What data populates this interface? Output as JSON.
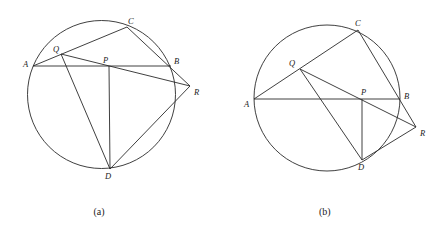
{
  "figures": [
    {
      "id": "a",
      "caption": "(a)",
      "circle": {
        "cx": 101.5,
        "cy": 94.5,
        "r": 74
      },
      "points": {
        "A": {
          "x": 33,
          "y": 66,
          "label": "A"
        },
        "B": {
          "x": 171,
          "y": 66,
          "label": "B"
        },
        "C": {
          "x": 127,
          "y": 27,
          "label": "C"
        },
        "D": {
          "x": 110,
          "y": 169,
          "label": "D"
        },
        "P": {
          "x": 109,
          "y": 66,
          "label": "P"
        },
        "Q": {
          "x": 61,
          "y": 54,
          "label": "Q"
        },
        "R": {
          "x": 190,
          "y": 86,
          "label": "R"
        }
      },
      "segments": [
        [
          "A",
          "B"
        ],
        [
          "A",
          "C"
        ],
        [
          "C",
          "R"
        ],
        [
          "Q",
          "R"
        ],
        [
          "Q",
          "D"
        ],
        [
          "P",
          "D"
        ],
        [
          "D",
          "R"
        ]
      ]
    },
    {
      "id": "b",
      "caption": "(b)",
      "circle": {
        "cx": 327,
        "cy": 98,
        "r": 73
      },
      "points": {
        "A": {
          "x": 254,
          "y": 99,
          "label": "A"
        },
        "B": {
          "x": 400,
          "y": 99,
          "label": "B"
        },
        "C": {
          "x": 358,
          "y": 30,
          "label": "C"
        },
        "D": {
          "x": 362,
          "y": 160,
          "label": "D"
        },
        "P": {
          "x": 362,
          "y": 99,
          "label": "P"
        },
        "Q": {
          "x": 300,
          "y": 69,
          "label": "Q"
        },
        "R": {
          "x": 416,
          "y": 127,
          "label": "R"
        }
      },
      "segments": [
        [
          "A",
          "B"
        ],
        [
          "A",
          "C"
        ],
        [
          "C",
          "R"
        ],
        [
          "Q",
          "R"
        ],
        [
          "Q",
          "D"
        ],
        [
          "P",
          "D"
        ],
        [
          "D",
          "R"
        ]
      ]
    }
  ]
}
